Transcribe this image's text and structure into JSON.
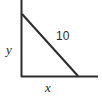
{
  "figure": {
    "type": "right-triangle-diagram",
    "background_color": "#ffffff",
    "stroke_color": "#2b2b2b",
    "stroke_width": 2,
    "axes": {
      "vertical": {
        "x": 21.5,
        "y_top": 0,
        "y_bottom": 77
      },
      "horizontal": {
        "y": 76.5,
        "x_left": 21,
        "x_right": 98
      }
    },
    "hypotenuse": {
      "x1": 22,
      "y1": 14,
      "x2": 78,
      "y2": 76
    },
    "labels": {
      "vertical_leg": "y",
      "horizontal_leg": "x",
      "hypotenuse": "10"
    }
  }
}
